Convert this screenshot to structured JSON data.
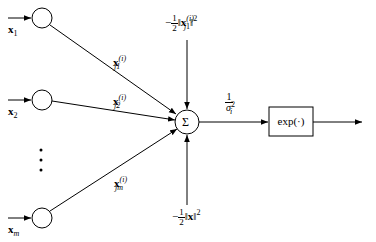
{
  "diagram": {
    "type": "rbf-neuron",
    "inputs": [
      {
        "id": "x1",
        "label": "x",
        "subscript": "1",
        "weight_label": "x",
        "weight_sup": "(i)",
        "weight_sub": "j1"
      },
      {
        "id": "x2",
        "label": "x",
        "subscript": "2",
        "weight_label": "x",
        "weight_sup": "(i)",
        "weight_sub": "j2"
      },
      {
        "id": "xm",
        "label": "x",
        "subscript": "m",
        "weight_label": "x",
        "weight_sup": "(i)",
        "weight_sub": "jm"
      }
    ],
    "ellipsis": "⋮",
    "summation": {
      "symbol": "Σ"
    },
    "top_bias": {
      "sign": "−",
      "frac_num": "1",
      "frac_den": "2",
      "norm_var": "x",
      "norm_sup": "(i)",
      "norm_sub": "j",
      "power": "2"
    },
    "bottom_bias": {
      "sign": "−",
      "frac_num": "1",
      "frac_den": "2",
      "norm_var": "x",
      "power": "2"
    },
    "scale": {
      "num": "1",
      "den_var": "σ",
      "den_sub": "i",
      "den_sup": "2"
    },
    "activation": {
      "label": "exp(·)"
    },
    "colors": {
      "stroke": "#000000",
      "background": "#ffffff"
    }
  }
}
